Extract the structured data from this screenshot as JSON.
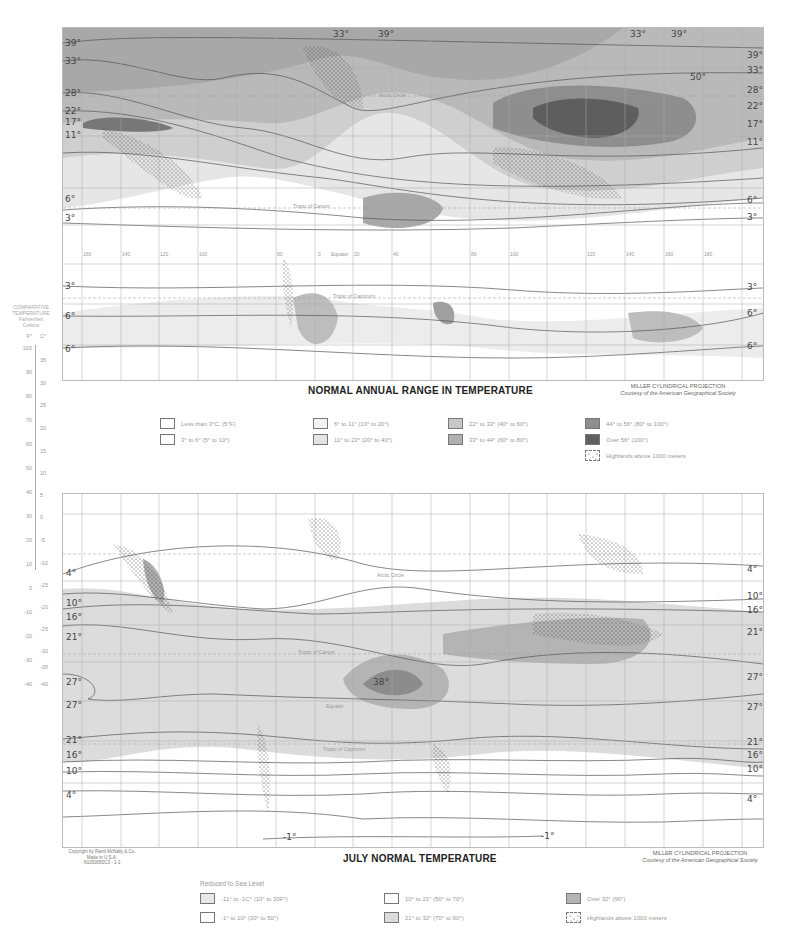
{
  "top_map": {
    "title": "NORMAL ANNUAL RANGE IN TEMPERATURE",
    "projection": "MILLER CYLINDRICAL PROJECTION",
    "courtesy": "Courtesy of the American Geographical Society",
    "left_isolines": [
      "39°",
      "33°",
      "28°",
      "22°",
      "17°",
      "11°",
      "6°",
      "3°",
      "3°",
      "6°",
      "6°"
    ],
    "right_isolines": [
      "39°",
      "33°",
      "28°",
      "22°",
      "17°",
      "11°",
      "6°",
      "3°",
      "3°",
      "6°",
      "6°"
    ],
    "top_isolines": [
      "39°",
      "33°",
      "33°",
      "39°"
    ],
    "peak_label": "50°",
    "place_labels": {
      "arctic_circle": "Arctic Circle",
      "tropic_cancer": "Tropic of Cancer",
      "equator": "Equator",
      "tropic_capricorn": "Tropic of Capricorn"
    },
    "longitudes": [
      "160",
      "140",
      "120",
      "100",
      "80",
      "60",
      "40",
      "20",
      "0",
      "20",
      "40",
      "60",
      "80",
      "100",
      "120",
      "140",
      "160",
      "180"
    ],
    "latitudes": [
      "80",
      "60",
      "40",
      "20",
      "0",
      "20",
      "40",
      "60"
    ],
    "legend": [
      {
        "label": "Less than 3°C. (5°F)",
        "color": "#ffffff"
      },
      {
        "label": "3° to 6° (5° to 10°)",
        "color": "#ffffff"
      },
      {
        "label": "6° to 11° (10° to 20°)",
        "color": "#f2f2f2"
      },
      {
        "label": "11° to 22° (20° to 40°)",
        "color": "#e4e4e4"
      },
      {
        "label": "22° to 33° (40° to 60°)",
        "color": "#c8c8c8"
      },
      {
        "label": "33° to 44° (60° to 80°)",
        "color": "#b0b0b0"
      },
      {
        "label": "44° to 56° (80° to 100°)",
        "color": "#8e8e8e"
      },
      {
        "label": "Over 56° (100°)",
        "color": "#606060"
      },
      {
        "label": "Highlands above 1000 meters",
        "color": "dotted"
      }
    ]
  },
  "bottom_map": {
    "title": "JULY NORMAL TEMPERATURE",
    "projection": "MILLER CYLINDRICAL PROJECTION",
    "courtesy": "Courtesy of the American Geographical Society",
    "left_isolines": [
      "4°",
      "10°",
      "16°",
      "21°",
      "27°",
      "27°",
      "21°",
      "16°",
      "10°",
      "4°"
    ],
    "right_isolines": [
      "4°",
      "10°",
      "16°",
      "21°",
      "27°",
      "27°",
      "21°",
      "16°",
      "10°",
      "4°"
    ],
    "bottom_isolines": [
      "-1°",
      "-1°"
    ],
    "peak_label": "38°",
    "place_labels": {
      "arctic_circle": "Arctic Circle",
      "tropic_cancer": "Tropic of Cancer",
      "equator": "Equator",
      "tropic_capricorn": "Tropic of Capricorn"
    },
    "copyright": [
      "Copyright by Rand McNally & Co.",
      "Made in U.S.A.",
      "N1050050C3 - 1-1"
    ],
    "legend_heading": "Reduced to Sea Level",
    "legend": [
      {
        "label": "-11° to -1C° (10° to 30F°)",
        "color": "#e8e8e8"
      },
      {
        "label": "-1° to 10° (30° to 50°)",
        "color": "#ffffff"
      },
      {
        "label": "10° to 21° (50° to 70°)",
        "color": "#ffffff"
      },
      {
        "label": "21° to 32° (70° to 90°)",
        "color": "#dcdcdc"
      },
      {
        "label": "Over 32° (90°)",
        "color": "#b4b4b4"
      },
      {
        "label": "Highlands above 1000 meters",
        "color": "dotted"
      }
    ]
  },
  "scale": {
    "heading": [
      "COMPARATIVE",
      "TEMPERATURE",
      "Fahrenheit",
      "Celsius"
    ],
    "units": [
      "F°",
      "C°"
    ],
    "fahrenheit": [
      "100",
      "90",
      "80",
      "70",
      "60",
      "50",
      "40",
      "30",
      "20",
      "10",
      "0",
      "-10",
      "-20",
      "-30",
      "-40"
    ],
    "celsius": [
      "35",
      "30",
      "25",
      "20",
      "15",
      "10",
      "5",
      "0",
      "-5",
      "-10",
      "-15",
      "-20",
      "-25",
      "-30",
      "-35",
      "-40"
    ]
  }
}
